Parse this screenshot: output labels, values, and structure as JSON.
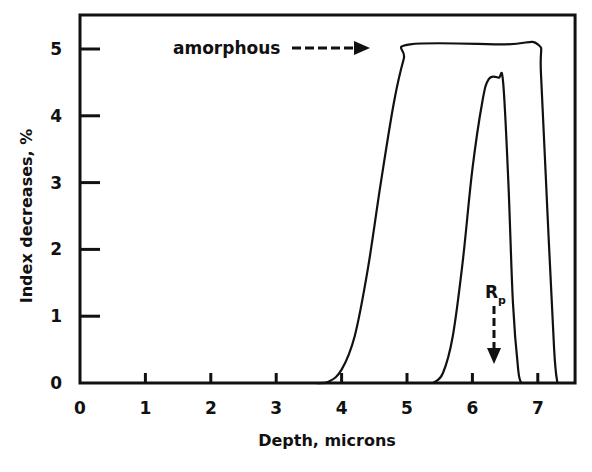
{
  "chart_data": {
    "type": "line",
    "title": "",
    "xlabel": "Depth, microns",
    "ylabel": "Index decreases, %",
    "xlim": [
      0,
      7.57
    ],
    "ylim": [
      0,
      5.45
    ],
    "xticks": [
      "0",
      "1",
      "2",
      "3",
      "4",
      "5",
      "6",
      "7"
    ],
    "yticks": [
      "0",
      "1",
      "2",
      "3",
      "4",
      "5"
    ],
    "grid": false,
    "legend": null,
    "series": [
      {
        "name": "wide profile (amorphous)",
        "x": [
          3.6,
          3.8,
          4.0,
          4.2,
          4.4,
          4.6,
          4.8,
          4.95,
          5.05,
          6.5,
          7.0,
          7.05,
          7.15,
          7.25,
          7.3
        ],
        "y": [
          0,
          0.02,
          0.2,
          0.7,
          1.7,
          3.0,
          4.2,
          4.85,
          5.07,
          5.07,
          5.07,
          4.6,
          2.5,
          0.5,
          0
        ]
      },
      {
        "name": "narrow profile",
        "x": [
          5.4,
          5.55,
          5.7,
          5.85,
          6.0,
          6.15,
          6.25,
          6.4,
          6.47,
          6.55,
          6.62,
          6.7,
          6.75
        ],
        "y": [
          0,
          0.15,
          0.7,
          1.8,
          3.2,
          4.2,
          4.55,
          4.57,
          4.5,
          3.0,
          1.2,
          0.2,
          0
        ]
      }
    ],
    "annotations": [
      {
        "text": "amorphous",
        "arrow": "dashed-right",
        "points_to_x": 4.4,
        "y": 5.0
      },
      {
        "text": "R",
        "subscript": "p",
        "arrow": "dashed-down",
        "x": 6.35,
        "points_to_y": 0.3
      }
    ]
  },
  "labels": {
    "xlabel": "Depth, microns",
    "ylabel": "Index decreases, %",
    "amorphous": "amorphous",
    "rp_main": "R",
    "rp_sub": "p"
  }
}
